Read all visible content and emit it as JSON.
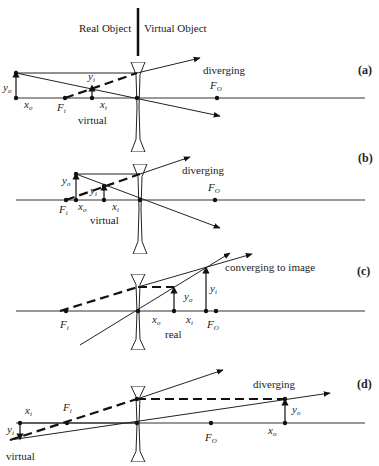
{
  "header": {
    "real_object_label": "Real Object",
    "virtual_object_label": "Virtual Object"
  },
  "panels": [
    {
      "id": "a",
      "tag": "(a)",
      "beam_label": "diverging",
      "image_type_label": "virtual",
      "labels": {
        "yo": "y",
        "yo_sub": "o",
        "yi": "y",
        "yi_sub": "i",
        "xo": "x",
        "xo_sub": "o",
        "xi": "x",
        "xi_sub": "i",
        "fi": "F",
        "fi_sub": "i",
        "fo": "F",
        "fo_sub": "O"
      }
    },
    {
      "id": "b",
      "tag": "(b)",
      "beam_label": "diverging",
      "image_type_label": "virtual",
      "labels": {
        "yo": "y",
        "yo_sub": "o",
        "yi": "y",
        "yi_sub": "i",
        "xo": "x",
        "xo_sub": "o",
        "xi": "x",
        "xi_sub": "i",
        "fi": "F",
        "fi_sub": "i",
        "fo": "F",
        "fo_sub": "O"
      }
    },
    {
      "id": "c",
      "tag": "(c)",
      "beam_label": "converging  to image",
      "image_type_label": "real",
      "labels": {
        "yo": "y",
        "yo_sub": "o",
        "yi": "y",
        "yi_sub": "i",
        "xo": "x",
        "xo_sub": "o",
        "xi": "x",
        "xi_sub": "i",
        "fi": "F",
        "fi_sub": "i",
        "fo": "F",
        "fo_sub": "O"
      }
    },
    {
      "id": "d",
      "tag": "(d)",
      "beam_label": "diverging",
      "image_type_label": "virtual",
      "labels": {
        "yo": "y",
        "yo_sub": "o",
        "yi": "y",
        "yi_sub": "i",
        "xo": "x",
        "xo_sub": "o",
        "xi": "x",
        "xi_sub": "i",
        "fi": "F",
        "fi_sub": "i",
        "fo": "F",
        "fo_sub": "O"
      }
    }
  ]
}
